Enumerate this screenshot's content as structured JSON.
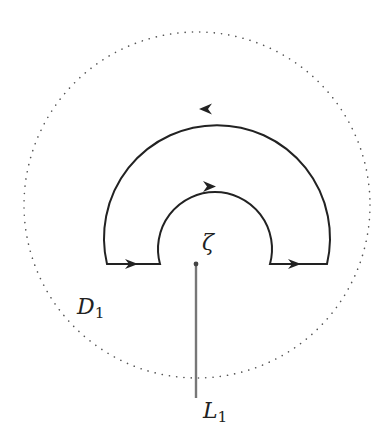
{
  "diagram": {
    "labels": {
      "zeta": "ζ",
      "disc_main": "D",
      "disc_sub": "1",
      "cut_main": "L",
      "cut_sub": "1"
    },
    "colors": {
      "contour": "#222222",
      "dotted_circle": "#555555",
      "branch_cut": "#777777",
      "background": "#ffffff"
    },
    "elements": {
      "dotted_circle": {
        "cx": 197,
        "cy": 205,
        "r": 173,
        "style": "dotted"
      },
      "outer_arc": {
        "cx": 215,
        "cy": 222,
        "r": 113,
        "direction": "counterclockwise (arrow pointing left at top)"
      },
      "inner_arc": {
        "cx": 215,
        "cy": 243,
        "r": 57,
        "direction": "clockwise (arrow pointing right at top)"
      },
      "left_segment": {
        "y": 264,
        "x1": 107,
        "x2": 160,
        "arrow": "right"
      },
      "right_segment": {
        "y": 264,
        "x1": 270,
        "x2": 327,
        "arrow": "right"
      },
      "branch_point": {
        "x": 196,
        "y": 264
      },
      "branch_cut": {
        "x": 196,
        "y1": 264,
        "y2": 398
      }
    }
  }
}
